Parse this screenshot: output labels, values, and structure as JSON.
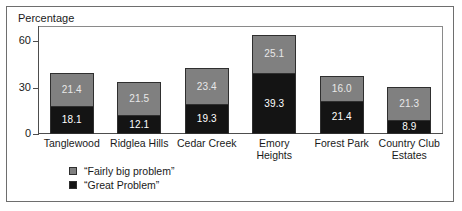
{
  "chart_data": {
    "type": "bar",
    "stacked": true,
    "title": "",
    "ylabel": "Percentage",
    "xlabel": "",
    "ylim": [
      0,
      70
    ],
    "yticks": [
      0,
      30,
      60
    ],
    "ytick_labels": [
      "0",
      "30",
      "60"
    ],
    "grid": false,
    "legend_position": "bottom-left",
    "categories": [
      "Tanglewood",
      "Ridglea Hills",
      "Cedar Creek",
      "Emory Heights",
      "Forest Park",
      "Country Club Estates"
    ],
    "series": [
      {
        "name": "“Great Problem”",
        "color": "#141414",
        "values": [
          18.1,
          12.1,
          19.3,
          39.3,
          21.4,
          8.9
        ]
      },
      {
        "name": "“Fairly big problem”",
        "color": "#808080",
        "values": [
          21.4,
          21.5,
          23.4,
          25.1,
          16.0,
          21.3
        ]
      }
    ],
    "totals": [
      39.5,
      33.6,
      42.7,
      64.4,
      37.4,
      30.2
    ]
  },
  "axis": {
    "y_title": "Percentage"
  },
  "legend": {
    "items": [
      {
        "label": "“Fairly big problem”",
        "swatch": "gray"
      },
      {
        "label": "“Great Problem”",
        "swatch": "black"
      }
    ]
  }
}
